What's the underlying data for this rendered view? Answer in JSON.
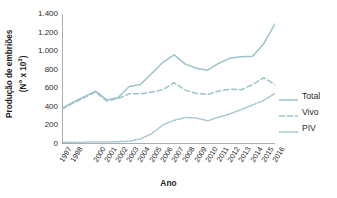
{
  "chart_data": {
    "type": "line",
    "title": "",
    "xlabel": "Ano",
    "ylabel_line1": "Produção de embriões",
    "ylabel_line2": "(Nº x 10³)",
    "ylabel": "Produção de embriões (Nº x 10³)",
    "ylim": [
      0,
      1400
    ],
    "yticks": [
      0,
      200,
      400,
      600,
      800,
      1000,
      1200,
      1400
    ],
    "ytick_labels": [
      "0",
      "200",
      "400",
      "600",
      "800",
      "1.000",
      "1.200",
      "1.400"
    ],
    "grid": false,
    "legend_position": "right",
    "x": [
      1997,
      1998,
      1999,
      2000,
      2001,
      2002,
      2003,
      2004,
      2005,
      2006,
      2007,
      2008,
      2009,
      2010,
      2011,
      2012,
      2013,
      2014,
      2015,
      2016
    ],
    "xtick_labels": [
      "1997",
      "1998",
      "2000",
      "2001",
      "2002",
      "2003",
      "2004",
      "2005",
      "2006",
      "2007",
      "2008",
      "2009",
      "2010",
      "2011",
      "2012",
      "2013",
      "2014",
      "2015",
      "2016"
    ],
    "series": [
      {
        "name": "Total",
        "style": "solid",
        "color": "#9cc3cc",
        "values": [
          385,
          450,
          510,
          570,
          475,
          500,
          620,
          640,
          760,
          880,
          960,
          860,
          815,
          795,
          870,
          925,
          940,
          945,
          1080,
          1295
        ]
      },
      {
        "name": "Vivo",
        "style": "dashed",
        "color": "#9cc3cc",
        "values": [
          375,
          440,
          500,
          560,
          462,
          490,
          540,
          540,
          560,
          585,
          660,
          580,
          545,
          535,
          570,
          590,
          585,
          640,
          715,
          640
        ]
      },
      {
        "name": "PIV",
        "style": "dotted",
        "color": "#9cc3cc",
        "values": [
          18,
          18,
          20,
          22,
          22,
          25,
          30,
          55,
          110,
          205,
          255,
          285,
          280,
          250,
          290,
          325,
          370,
          420,
          470,
          545
        ]
      }
    ],
    "series_extended_note": "",
    "legend": [
      {
        "label": "Total",
        "style": "solid"
      },
      {
        "label": "Vivo",
        "style": "dashed"
      },
      {
        "label": "PIV",
        "style": "dotted"
      }
    ]
  },
  "colors": {
    "line": "#9cc3cc",
    "axis": "#4a4a4a",
    "text": "#2b2b2b",
    "background": "#ffffff"
  }
}
